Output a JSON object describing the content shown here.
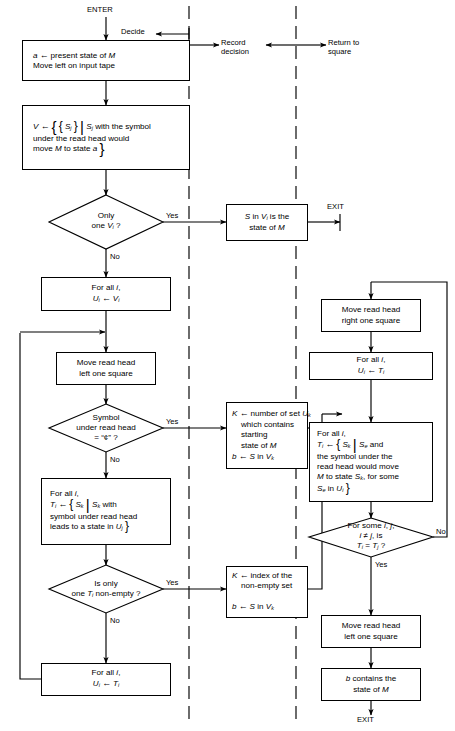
{
  "diagram": {
    "type": "flowchart",
    "columns": [
      {
        "id": "decide",
        "label": "Decide"
      },
      {
        "id": "record",
        "label": "Record\ndecision"
      },
      {
        "id": "return",
        "label": "Return to\nsquare"
      }
    ],
    "terminals": {
      "enter": "ENTER",
      "exit_top": "EXIT",
      "exit_bottom": "EXIT"
    },
    "edge_labels": {
      "yes": "Yes",
      "no": "No"
    },
    "nodes": [
      {
        "id": "n1",
        "shape": "process",
        "lines": [
          "a ← present state of M",
          "Move left on input tape"
        ]
      },
      {
        "id": "n2",
        "shape": "process",
        "lines": [
          "V ← { { Sⱼ } | Sⱼ with the symbol",
          "under the read head would",
          "move M to state a }"
        ]
      },
      {
        "id": "d1",
        "shape": "decision",
        "lines": [
          "Only",
          "one Vᵢ ?"
        ]
      },
      {
        "id": "n3",
        "shape": "process",
        "lines": [
          "S in Vᵢ is the",
          "state of M"
        ]
      },
      {
        "id": "n4",
        "shape": "process",
        "lines": [
          "For all i,",
          "Uᵢ ← Vᵢ"
        ]
      },
      {
        "id": "n5",
        "shape": "process",
        "lines": [
          "Move read head",
          "left one square"
        ]
      },
      {
        "id": "d2",
        "shape": "decision",
        "lines": [
          "Symbol",
          "under read head",
          "= “¢” ?"
        ]
      },
      {
        "id": "n6",
        "shape": "process",
        "lines": [
          "K ← number of set Uₖ",
          "which contains",
          "starting",
          "state of M",
          "b ← S in Vₖ"
        ]
      },
      {
        "id": "n7",
        "shape": "process",
        "lines": [
          "For all i,",
          "Tᵢ ← { Sₖ | Sₖ with",
          "symbol under read head",
          "leads to a state in Uⱼ }"
        ]
      },
      {
        "id": "d3",
        "shape": "decision",
        "lines": [
          "Is only",
          "one Tᵢ non-empty ?"
        ]
      },
      {
        "id": "n8",
        "shape": "process",
        "lines": [
          "K ← index of the",
          "non-empty set",
          "b ← S in Vₖ"
        ]
      },
      {
        "id": "n9",
        "shape": "process",
        "lines": [
          "For all i,",
          "Uᵢ ← Tᵢ"
        ]
      },
      {
        "id": "n10",
        "shape": "process",
        "lines": [
          "Move read head",
          "right one square"
        ]
      },
      {
        "id": "n11",
        "shape": "process",
        "lines": [
          "For all i,",
          "Uᵢ ← Tᵢ"
        ]
      },
      {
        "id": "n12",
        "shape": "process",
        "lines": [
          "For all i,",
          "Tᵢ ← { Sₖ | Sₖ and",
          "the symbol under the",
          "read head would move",
          "M to state Sₖ, for some",
          "Sₑ in Uᵢ }"
        ]
      },
      {
        "id": "d4",
        "shape": "decision",
        "lines": [
          "For some i, j,",
          "i ≠ j, is",
          "Tᵢ = Tⱼ ?"
        ]
      },
      {
        "id": "n13",
        "shape": "process",
        "lines": [
          "Move read head",
          "left one square"
        ]
      },
      {
        "id": "n14",
        "shape": "process",
        "lines": [
          "b contains the",
          "state of M"
        ]
      }
    ],
    "colors": {
      "line": "#000000",
      "background": "#ffffff"
    }
  }
}
